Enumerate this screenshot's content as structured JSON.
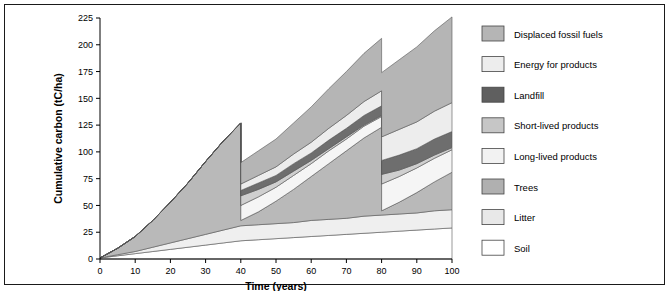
{
  "chart_data": {
    "type": "area",
    "title": "",
    "xlabel": "Time (years)",
    "ylabel": "Cumulative carbon (tC/ha)",
    "xlim": [
      0,
      100
    ],
    "ylim": [
      0,
      225
    ],
    "xticks": [
      0,
      10,
      20,
      30,
      40,
      50,
      60,
      70,
      80,
      90,
      100
    ],
    "yticks": [
      0,
      25,
      50,
      75,
      100,
      125,
      150,
      175,
      200,
      225
    ],
    "grid": false,
    "legend_position": "right",
    "stacked": true,
    "x": [
      0,
      5,
      10,
      15,
      20,
      25,
      30,
      35,
      40,
      40.01,
      45,
      50,
      55,
      60,
      65,
      70,
      75,
      80,
      80.01,
      85,
      90,
      95,
      100
    ],
    "series": [
      {
        "name": "Soil",
        "color": "#ffffff",
        "values": [
          1,
          3,
          5,
          7,
          9,
          11,
          13,
          15,
          17,
          17,
          18,
          19,
          20,
          21,
          22,
          23,
          24,
          25,
          25,
          26,
          27,
          28,
          29
        ]
      },
      {
        "name": "Litter",
        "color": "#efefef",
        "values": [
          0,
          1,
          2,
          4,
          6,
          8,
          10,
          12,
          14,
          14,
          14,
          14,
          14,
          15,
          15,
          15,
          16,
          16,
          16,
          16,
          16,
          17,
          17
        ]
      },
      {
        "name": "Trees",
        "color": "#b9b9b9",
        "values": [
          0,
          6,
          14,
          25,
          38,
          52,
          68,
          83,
          96,
          5,
          12,
          21,
          31,
          41,
          52,
          63,
          73,
          82,
          4,
          11,
          19,
          27,
          35
        ]
      },
      {
        "name": "Long-lived products",
        "color": "#f5f5f5",
        "values": [
          0,
          0,
          0,
          0,
          0,
          0,
          0,
          0,
          0,
          14,
          14,
          13,
          13,
          12,
          12,
          11,
          11,
          10,
          25,
          24,
          23,
          22,
          21
        ]
      },
      {
        "name": "Short-lived products",
        "color": "#cfcfcf",
        "values": [
          0,
          0,
          0,
          0,
          0,
          0,
          0,
          0,
          0,
          9,
          7,
          5,
          4,
          3,
          2,
          2,
          1,
          1,
          9,
          6,
          4,
          3,
          2
        ]
      },
      {
        "name": "Landfill",
        "color": "#6e6e6e",
        "values": [
          0,
          0,
          0,
          0,
          0,
          0,
          0,
          0,
          0,
          5,
          6,
          6,
          7,
          7,
          8,
          8,
          9,
          9,
          13,
          14,
          14,
          15,
          15
        ]
      },
      {
        "name": "Energy for products",
        "color": "#ededed",
        "values": [
          0,
          0,
          0,
          0,
          0,
          0,
          0,
          0,
          0,
          6,
          7,
          8,
          9,
          10,
          11,
          12,
          13,
          14,
          22,
          24,
          25,
          26,
          27
        ]
      },
      {
        "name": "Displaced fossil fuels",
        "color": "#b5b5b5",
        "values": [
          0,
          0,
          0,
          0,
          0,
          0,
          0,
          0,
          0,
          20,
          23,
          26,
          29,
          33,
          37,
          41,
          45,
          49,
          60,
          65,
          70,
          75,
          80
        ]
      }
    ]
  },
  "legend": {
    "items": [
      {
        "label": "Displaced fossil fuels",
        "color": "#b5b5b5"
      },
      {
        "label": "Energy for products",
        "color": "#ededed"
      },
      {
        "label": "Landfill",
        "color": "#5f5f5f"
      },
      {
        "label": "Short-lived products",
        "color": "#c6c6c6"
      },
      {
        "label": "Long-lived products",
        "color": "#f2f2f2"
      },
      {
        "label": "Trees",
        "color": "#b0b0b0"
      },
      {
        "label": "Litter",
        "color": "#e8e8e8"
      },
      {
        "label": "Soil",
        "color": "#ffffff"
      }
    ]
  }
}
